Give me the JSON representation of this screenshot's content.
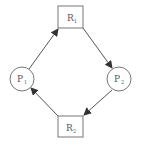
{
  "diagram": {
    "type": "resource-allocation-graph",
    "colors": {
      "stroke": "#555555",
      "node_stroke": "#777777",
      "text": "#555555",
      "background": "#ffffff"
    },
    "nodes": [
      {
        "id": "R1",
        "shape": "rect",
        "letter": "R",
        "sub": "1",
        "x": 58,
        "y": 6,
        "w": 25,
        "h": 22
      },
      {
        "id": "P2",
        "shape": "circle",
        "letter": "P",
        "sub": "2",
        "cx": 119,
        "cy": 79,
        "r": 12
      },
      {
        "id": "R2",
        "shape": "rect",
        "letter": "R",
        "sub": "2",
        "x": 58,
        "y": 116,
        "w": 25,
        "h": 21
      },
      {
        "id": "P1",
        "shape": "circle",
        "letter": "P",
        "sub": "1",
        "cx": 22,
        "cy": 79,
        "r": 12
      }
    ],
    "edges": [
      {
        "from": "P1",
        "to": "R1"
      },
      {
        "from": "R1",
        "to": "P2"
      },
      {
        "from": "P2",
        "to": "R2"
      },
      {
        "from": "R2",
        "to": "P1"
      }
    ]
  }
}
